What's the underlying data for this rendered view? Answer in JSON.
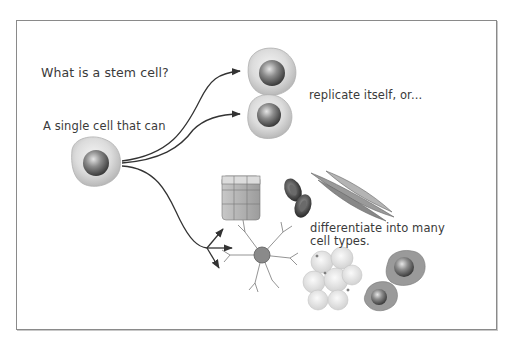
{
  "diagram": {
    "title": "What is a stem cell?",
    "intro": "A single cell that can",
    "outcome_1": "replicate itself, or...",
    "outcome_2_line1": "differentiate into many",
    "outcome_2_line2": "cell types.",
    "colors": {
      "text": "#3a3a3a",
      "frame": "#8a8a8a",
      "cell_body": "#d8d8d8",
      "nucleus": "#7a7a7a",
      "arrow": "#333333"
    },
    "nodes": [
      {
        "id": "stem-cell",
        "label": "stem cell"
      },
      {
        "id": "daughter-cell-1",
        "label": "replicated cell"
      },
      {
        "id": "daughter-cell-2",
        "label": "replicated cell"
      },
      {
        "id": "epithelial-cells",
        "label": "epithelial cells"
      },
      {
        "id": "red-blood-cells",
        "label": "red blood cells"
      },
      {
        "id": "muscle-cells",
        "label": "smooth muscle cells"
      },
      {
        "id": "neuron",
        "label": "nerve cell"
      },
      {
        "id": "fat-cells",
        "label": "fat cells"
      },
      {
        "id": "blood-cells",
        "label": "white blood cells"
      }
    ]
  }
}
